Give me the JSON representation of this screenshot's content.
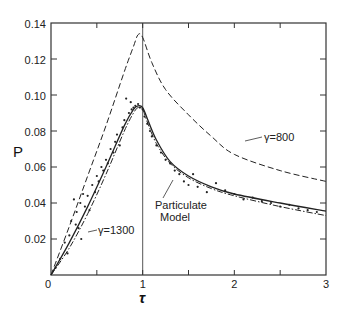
{
  "chart_data": {
    "type": "line",
    "title": "",
    "xlabel": "τ",
    "ylabel": "P",
    "xlim": [
      0,
      3
    ],
    "ylim": [
      0,
      0.14
    ],
    "grid": false,
    "x_ticks": [
      "0",
      "1",
      "2",
      "3"
    ],
    "x_minor_ticks": [
      0.5,
      1.5,
      2.5
    ],
    "y_ticks": [
      "0.02",
      "0.04",
      "0.06",
      "0.08",
      "0.10",
      "0.12",
      "0.14"
    ],
    "vertical_line": {
      "x": 1.0
    },
    "series": [
      {
        "name": "γ=800",
        "style": "dashed",
        "x": [
          0,
          0.2,
          0.4,
          0.6,
          0.8,
          0.9,
          0.95,
          1.0,
          1.1,
          1.25,
          1.5,
          1.75,
          2.0,
          2.5,
          3.0
        ],
        "y": [
          0,
          0.027,
          0.055,
          0.083,
          0.113,
          0.127,
          0.1335,
          0.132,
          0.118,
          0.103,
          0.089,
          0.077,
          0.067,
          0.058,
          0.052
        ]
      },
      {
        "name": "Particulate Model",
        "style": "solid",
        "x": [
          0,
          0.2,
          0.4,
          0.6,
          0.8,
          0.9,
          0.95,
          1.0,
          1.05,
          1.15,
          1.3,
          1.5,
          1.75,
          2.0,
          2.5,
          3.0
        ],
        "y": [
          0,
          0.018,
          0.038,
          0.06,
          0.083,
          0.092,
          0.094,
          0.093,
          0.087,
          0.075,
          0.063,
          0.055,
          0.049,
          0.045,
          0.04,
          0.0355
        ]
      },
      {
        "name": "γ=1300",
        "style": "dash-dot",
        "x": [
          0,
          0.2,
          0.4,
          0.6,
          0.8,
          0.9,
          0.95,
          1.0,
          1.05,
          1.15,
          1.3,
          1.5,
          1.75,
          2.0,
          2.5,
          3.0
        ],
        "y": [
          0,
          0.015,
          0.034,
          0.056,
          0.08,
          0.09,
          0.093,
          0.092,
          0.085,
          0.073,
          0.062,
          0.054,
          0.048,
          0.044,
          0.038,
          0.033
        ]
      },
      {
        "name": "experimental points",
        "style": "scatter",
        "x": [
          0.05,
          0.1,
          0.15,
          0.18,
          0.2,
          0.22,
          0.25,
          0.27,
          0.28,
          0.3,
          0.32,
          0.33,
          0.35,
          0.37,
          0.4,
          0.42,
          0.45,
          0.48,
          0.5,
          0.52,
          0.55,
          0.57,
          0.6,
          0.62,
          0.65,
          0.68,
          0.7,
          0.72,
          0.75,
          0.78,
          0.8,
          0.82,
          0.85,
          0.87,
          0.88,
          0.9,
          0.92,
          0.95,
          0.97,
          1.0,
          1.02,
          1.05,
          1.08,
          1.1,
          1.15,
          1.2,
          1.25,
          1.3,
          1.35,
          1.4,
          1.45,
          1.5,
          1.55,
          1.6,
          1.7,
          1.8,
          1.9,
          2.0,
          2.1,
          2.2,
          2.3,
          2.4,
          2.5,
          2.6,
          2.7,
          2.8,
          2.9
        ],
        "y": [
          0.004,
          0.009,
          0.018,
          0.012,
          0.022,
          0.03,
          0.042,
          0.028,
          0.035,
          0.026,
          0.04,
          0.02,
          0.045,
          0.038,
          0.044,
          0.036,
          0.05,
          0.046,
          0.055,
          0.052,
          0.06,
          0.058,
          0.064,
          0.062,
          0.07,
          0.068,
          0.074,
          0.078,
          0.072,
          0.082,
          0.086,
          0.098,
          0.09,
          0.096,
          0.092,
          0.093,
          0.094,
          0.095,
          0.093,
          0.092,
          0.088,
          0.084,
          0.08,
          0.077,
          0.072,
          0.068,
          0.064,
          0.062,
          0.058,
          0.056,
          0.052,
          0.05,
          0.056,
          0.049,
          0.046,
          0.051,
          0.047,
          0.045,
          0.042,
          0.043,
          0.041,
          0.04,
          0.038,
          0.039,
          0.037,
          0.036,
          0.035
        ]
      }
    ],
    "annotations": [
      {
        "text": "γ=800",
        "x": 2.3,
        "y": 0.075
      },
      {
        "text": "Particulate",
        "x": 1.45,
        "y": 0.041
      },
      {
        "text": "Model",
        "x": 1.55,
        "y": 0.036
      },
      {
        "text": "γ=1300",
        "x": 0.62,
        "y": 0.031
      }
    ]
  },
  "labels": {
    "xlabel": "τ",
    "ylabel": "P",
    "gamma800": "γ=800",
    "gamma1300": "γ=1300",
    "particulate_line1": "Particulate",
    "particulate_line2": "Model",
    "x0": "0",
    "x1": "1",
    "x2": "2",
    "x3": "3",
    "y002": "0.02",
    "y004": "0.04",
    "y006": "0.06",
    "y008": "0.08",
    "y010": "0.10",
    "y012": "0.12",
    "y014": "0.14"
  }
}
